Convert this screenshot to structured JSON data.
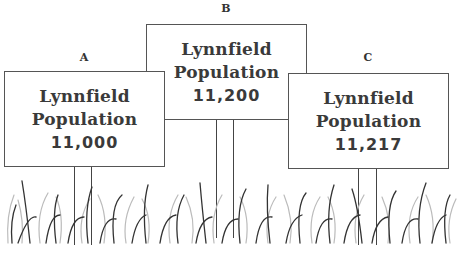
{
  "signs": [
    {
      "label": "A",
      "line1": "Lynnfield",
      "line2": "Population",
      "value": "11,000"
    },
    {
      "label": "B",
      "line1": "Lynnfield",
      "line2": "Population",
      "value": "11,200"
    },
    {
      "label": "C",
      "line1": "Lynnfield",
      "line2": "Population",
      "value": "11,217"
    }
  ]
}
